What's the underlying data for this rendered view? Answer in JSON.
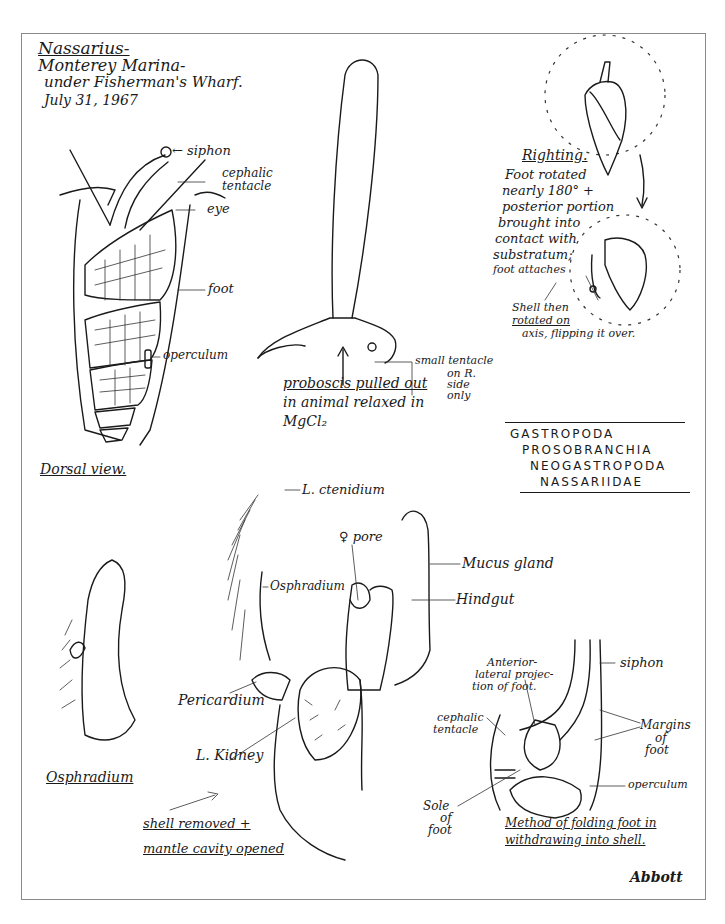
{
  "header": {
    "genus": "Nassarius-",
    "location_line1": "Monterey Marina-",
    "location_line2": "under Fisherman's Wharf.",
    "date": "July 31, 1967"
  },
  "dorsal_view": {
    "caption": "Dorsal view.",
    "labels": {
      "siphon": "← siphon",
      "cephalic_tentacle_1": "cephalic",
      "cephalic_tentacle_2": "tentacle",
      "eye": "eye",
      "foot": "foot",
      "operculum": "operculum"
    }
  },
  "proboscis": {
    "caption_line1": "proboscis pulled out",
    "caption_line2": "in animal relaxed in",
    "caption_line3": "MgCl₂",
    "small_tentacle_1": "small tentacle",
    "small_tentacle_2": "on R.",
    "small_tentacle_3": "side",
    "small_tentacle_4": "only"
  },
  "righting": {
    "title": "Righting.",
    "text": [
      "Foot rotated",
      "nearly 180° +",
      "posterior portion",
      "brought into",
      "contact with",
      "substratum;",
      "foot attaches"
    ],
    "shell_text": [
      "Shell then",
      "rotated on",
      "axis, flipping it over."
    ]
  },
  "taxonomy": {
    "lines": [
      "GASTROPODA",
      "PROSOBRANCHIA",
      "NEOGASTROPODA",
      "NASSARIIDAE"
    ]
  },
  "mantle_cavity": {
    "labels": {
      "ctenidium": "L. ctenidium",
      "female_pore": "♀ pore",
      "osphradium": "Osphradium",
      "mucus_gland": "Mucus gland",
      "hindgut": "Hindgut",
      "pericardium": "Pericardium",
      "kidney": "L. Kidney"
    },
    "caption_line1": "shell removed +",
    "caption_line2": "mantle cavity opened"
  },
  "osphradium_detail": {
    "caption": "Osphradium"
  },
  "folding_foot": {
    "labels": {
      "anterior_1": "Anterior-",
      "anterior_2": "lateral projec-",
      "anterior_3": "tion of foot.",
      "siphon": "siphon",
      "cephalic_1": "cephalic",
      "cephalic_2": "tentacle",
      "margins_1": "Margins",
      "margins_2": "of",
      "margins_3": "foot",
      "operculum": "operculum",
      "sole_1": "Sole",
      "sole_2": "of",
      "sole_3": "foot"
    },
    "caption_line1": "Method of folding foot in",
    "caption_line2": "withdrawing into shell."
  },
  "signature": "Abbott"
}
